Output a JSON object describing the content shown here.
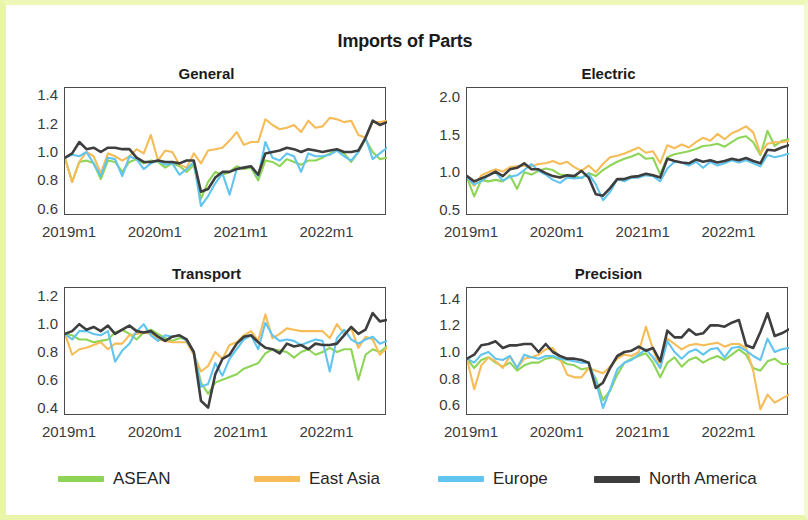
{
  "figure": {
    "title": "Imports of Parts",
    "background_color": "#ffffff",
    "frame_color": "#e9f5a8"
  },
  "legend": {
    "position": "bottom",
    "entries": [
      {
        "label": "ASEAN",
        "color": "#8ed557"
      },
      {
        "label": "East Asia",
        "color": "#f5bc57"
      },
      {
        "label": "Europe",
        "color": "#62c5ef"
      },
      {
        "label": "North America",
        "color": "#3e3e3e"
      }
    ]
  },
  "chart_data": [
    {
      "type": "line",
      "title": "General",
      "xlabel": "",
      "ylabel": "",
      "grid": false,
      "legend_position": "figure-bottom",
      "xticklabels": [
        "2019m1",
        "2020m1",
        "2021m1",
        "2022m1"
      ],
      "xtick_index": [
        0,
        12,
        24,
        36
      ],
      "yticks": [
        0.6,
        0.8,
        1.0,
        1.2,
        1.4
      ],
      "ylim": [
        0.55,
        1.45
      ],
      "xlim": [
        0,
        45
      ],
      "series": [
        {
          "name": "ASEAN",
          "color": "#8ed557",
          "values": [
            0.96,
            0.79,
            0.93,
            0.94,
            0.92,
            0.81,
            0.94,
            0.93,
            0.86,
            0.93,
            0.95,
            0.92,
            0.94,
            0.93,
            0.89,
            0.92,
            0.9,
            0.86,
            0.91,
            0.67,
            0.79,
            0.86,
            0.84,
            0.86,
            0.9,
            0.88,
            0.89,
            0.8,
            0.94,
            0.93,
            0.9,
            0.95,
            0.93,
            0.91,
            0.94,
            0.94,
            0.96,
            0.99,
            1.01,
            0.99,
            0.93,
            1.0,
            1.09,
            1.0,
            0.95,
            0.96
          ]
        },
        {
          "name": "East Asia",
          "color": "#f5bc57",
          "values": [
            0.95,
            0.79,
            0.93,
            1.0,
            0.97,
            0.85,
            0.99,
            0.97,
            0.94,
            0.97,
            1.02,
            0.99,
            1.12,
            0.94,
            1.01,
            1.0,
            0.91,
            0.89,
            0.99,
            0.92,
            1.01,
            1.02,
            1.03,
            1.08,
            1.14,
            1.05,
            1.07,
            1.07,
            1.23,
            1.19,
            1.16,
            1.17,
            1.19,
            1.14,
            1.22,
            1.17,
            1.18,
            1.24,
            1.23,
            1.21,
            1.22,
            1.12,
            1.1,
            1.21,
            1.21,
            1.22
          ]
        },
        {
          "name": "Europe",
          "color": "#62c5ef",
          "values": [
            0.96,
            0.98,
            0.97,
            1.0,
            0.92,
            0.83,
            0.96,
            0.95,
            0.83,
            0.97,
            0.95,
            0.88,
            0.92,
            0.94,
            0.91,
            0.92,
            0.84,
            0.88,
            0.93,
            0.62,
            0.69,
            0.78,
            0.85,
            0.7,
            0.88,
            0.89,
            0.9,
            0.83,
            1.07,
            0.96,
            0.94,
            0.99,
            0.97,
            0.86,
            0.99,
            0.97,
            0.97,
            0.98,
            1.01,
            0.97,
            0.94,
            1.0,
            1.1,
            0.95,
            0.99,
            1.03
          ]
        },
        {
          "name": "North America",
          "color": "#3e3e3e",
          "values": [
            0.96,
            0.99,
            1.07,
            1.02,
            1.03,
            1.0,
            1.03,
            1.03,
            1.02,
            1.02,
            0.96,
            0.93,
            0.93,
            0.94,
            0.93,
            0.93,
            0.92,
            0.94,
            0.94,
            0.72,
            0.74,
            0.82,
            0.86,
            0.86,
            0.88,
            0.89,
            0.9,
            0.84,
            0.99,
            1.0,
            1.01,
            1.03,
            1.02,
            1.0,
            1.02,
            1.01,
            1.0,
            1.01,
            1.02,
            1.0,
            1.0,
            1.01,
            1.1,
            1.22,
            1.19,
            1.21
          ]
        }
      ]
    },
    {
      "type": "line",
      "title": "Electric",
      "xlabel": "",
      "ylabel": "",
      "grid": false,
      "legend_position": "figure-bottom",
      "xticklabels": [
        "2019m1",
        "2020m1",
        "2021m1",
        "2022m1"
      ],
      "xtick_index": [
        0,
        12,
        24,
        36
      ],
      "yticks": [
        0.5,
        1.0,
        1.5,
        2.0
      ],
      "ylim": [
        0.42,
        2.12
      ],
      "xlim": [
        0,
        45
      ],
      "series": [
        {
          "name": "ASEAN",
          "color": "#8ed557",
          "values": [
            0.93,
            0.68,
            0.9,
            0.88,
            0.9,
            0.88,
            0.96,
            0.78,
            1.0,
            0.97,
            1.02,
            1.05,
            1.03,
            0.97,
            0.96,
            0.95,
            0.92,
            0.99,
            0.95,
            1.03,
            1.09,
            1.14,
            1.18,
            1.21,
            1.25,
            1.18,
            1.19,
            0.97,
            1.2,
            1.24,
            1.26,
            1.28,
            1.31,
            1.35,
            1.36,
            1.38,
            1.34,
            1.4,
            1.46,
            1.48,
            1.4,
            1.23,
            1.55,
            1.35,
            1.42,
            1.44
          ]
        },
        {
          "name": "East Asia",
          "color": "#f5bc57",
          "values": [
            0.93,
            0.82,
            0.96,
            1.0,
            1.04,
            1.01,
            1.07,
            1.08,
            1.09,
            1.08,
            1.11,
            1.12,
            1.15,
            1.11,
            1.14,
            1.07,
            1.02,
            1.09,
            1.0,
            1.11,
            1.2,
            1.22,
            1.25,
            1.29,
            1.33,
            1.26,
            1.28,
            1.12,
            1.36,
            1.32,
            1.37,
            1.33,
            1.4,
            1.46,
            1.42,
            1.51,
            1.44,
            1.52,
            1.56,
            1.61,
            1.53,
            1.25,
            1.38,
            1.4,
            1.4,
            1.42
          ]
        },
        {
          "name": "Europe",
          "color": "#62c5ef",
          "values": [
            0.93,
            0.84,
            0.88,
            0.96,
            1.0,
            0.89,
            0.94,
            0.96,
            1.03,
            1.11,
            1.02,
            0.97,
            0.9,
            0.86,
            0.93,
            0.92,
            0.93,
            0.98,
            0.84,
            0.63,
            0.74,
            0.91,
            0.88,
            0.93,
            0.93,
            0.96,
            0.95,
            0.88,
            1.05,
            1.14,
            1.13,
            1.09,
            1.14,
            1.06,
            1.14,
            1.09,
            1.12,
            1.16,
            1.13,
            1.16,
            1.12,
            1.08,
            1.23,
            1.2,
            1.22,
            1.25
          ]
        },
        {
          "name": "North America",
          "color": "#3e3e3e",
          "values": [
            0.95,
            0.88,
            0.92,
            0.96,
            1.01,
            0.95,
            1.04,
            1.06,
            1.12,
            1.04,
            1.04,
            0.99,
            0.95,
            0.93,
            0.96,
            0.95,
            1.02,
            0.93,
            0.71,
            0.69,
            0.79,
            0.91,
            0.91,
            0.94,
            0.95,
            0.98,
            0.96,
            0.93,
            1.18,
            1.15,
            1.13,
            1.12,
            1.17,
            1.14,
            1.16,
            1.13,
            1.15,
            1.18,
            1.16,
            1.19,
            1.15,
            1.12,
            1.3,
            1.29,
            1.33,
            1.36
          ]
        }
      ]
    },
    {
      "type": "line",
      "title": "Transport",
      "xlabel": "",
      "ylabel": "",
      "grid": false,
      "legend_position": "figure-bottom",
      "xticklabels": [
        "2019m1",
        "2020m1",
        "2021m1",
        "2022m1"
      ],
      "xtick_index": [
        0,
        12,
        24,
        36
      ],
      "yticks": [
        0.4,
        0.6,
        0.8,
        1.0,
        1.2
      ],
      "ylim": [
        0.34,
        1.26
      ],
      "xlim": [
        0,
        45
      ],
      "series": [
        {
          "name": "ASEAN",
          "color": "#8ed557",
          "values": [
            0.93,
            0.92,
            0.89,
            0.89,
            0.87,
            0.88,
            0.89,
            0.94,
            0.96,
            0.93,
            0.89,
            0.94,
            0.96,
            0.93,
            0.9,
            0.88,
            0.9,
            0.89,
            0.8,
            0.58,
            0.5,
            0.58,
            0.6,
            0.62,
            0.64,
            0.68,
            0.7,
            0.72,
            0.79,
            0.82,
            0.81,
            0.8,
            0.76,
            0.8,
            0.82,
            0.78,
            0.8,
            0.83,
            0.8,
            0.82,
            0.82,
            0.6,
            0.78,
            0.82,
            0.8,
            0.84
          ]
        },
        {
          "name": "East Asia",
          "color": "#f5bc57",
          "values": [
            0.93,
            0.78,
            0.82,
            0.83,
            0.85,
            0.87,
            0.82,
            0.86,
            0.86,
            0.92,
            0.93,
            0.94,
            0.93,
            0.89,
            0.88,
            0.87,
            0.87,
            0.87,
            0.78,
            0.66,
            0.7,
            0.8,
            0.75,
            0.85,
            0.87,
            0.92,
            0.95,
            0.88,
            1.07,
            0.9,
            0.93,
            0.97,
            0.96,
            0.95,
            0.95,
            0.95,
            0.95,
            0.9,
            1.0,
            0.93,
            0.97,
            0.83,
            0.91,
            0.89,
            0.78,
            0.83
          ]
        },
        {
          "name": "Europe",
          "color": "#62c5ef",
          "values": [
            0.93,
            0.89,
            0.95,
            0.95,
            0.93,
            0.92,
            0.95,
            0.73,
            0.81,
            0.86,
            0.95,
            1.0,
            0.92,
            0.88,
            0.92,
            0.91,
            0.92,
            0.88,
            0.8,
            0.55,
            0.57,
            0.72,
            0.63,
            0.75,
            0.82,
            0.89,
            0.92,
            0.82,
            1.01,
            0.92,
            0.88,
            0.89,
            0.88,
            0.85,
            0.87,
            0.89,
            0.88,
            0.66,
            0.9,
            0.96,
            0.89,
            0.86,
            0.89,
            0.91,
            0.86,
            0.88
          ]
        },
        {
          "name": "North America",
          "color": "#3e3e3e",
          "values": [
            0.93,
            0.95,
            1.0,
            0.96,
            0.98,
            0.95,
            0.99,
            0.93,
            0.96,
            0.99,
            0.95,
            0.94,
            0.95,
            0.91,
            0.88,
            0.91,
            0.92,
            0.89,
            0.8,
            0.45,
            0.4,
            0.64,
            0.75,
            0.78,
            0.86,
            0.91,
            0.92,
            0.87,
            0.83,
            0.82,
            0.79,
            0.86,
            0.84,
            0.85,
            0.82,
            0.86,
            0.85,
            0.85,
            0.86,
            0.92,
            0.98,
            0.93,
            0.96,
            1.08,
            1.02,
            1.03
          ]
        }
      ]
    },
    {
      "type": "line",
      "title": "Precision",
      "xlabel": "",
      "ylabel": "",
      "grid": false,
      "legend_position": "figure-bottom",
      "xticklabels": [
        "2019m1",
        "2020m1",
        "2021m1",
        "2022m1"
      ],
      "xtick_index": [
        0,
        12,
        24,
        36
      ],
      "yticks": [
        0.6,
        0.8,
        1.0,
        1.2,
        1.4
      ],
      "ylim": [
        0.52,
        1.48
      ],
      "xlim": [
        0,
        45
      ],
      "series": [
        {
          "name": "ASEAN",
          "color": "#8ed557",
          "values": [
            0.95,
            0.88,
            0.94,
            0.96,
            0.92,
            0.89,
            0.92,
            0.86,
            0.9,
            0.92,
            0.92,
            0.95,
            0.96,
            0.94,
            0.91,
            0.9,
            0.87,
            0.88,
            0.8,
            0.64,
            0.71,
            0.83,
            0.92,
            0.95,
            0.97,
            0.99,
            0.92,
            0.81,
            0.92,
            0.96,
            0.89,
            0.94,
            0.96,
            0.92,
            0.95,
            0.97,
            0.94,
            0.98,
            1.02,
            0.98,
            0.88,
            0.86,
            0.93,
            0.95,
            0.91,
            0.91
          ]
        },
        {
          "name": "East Asia",
          "color": "#f5bc57",
          "values": [
            0.95,
            0.72,
            0.9,
            0.96,
            0.93,
            0.88,
            0.97,
            0.88,
            0.95,
            0.96,
            0.98,
            1.02,
            1.03,
            0.95,
            0.83,
            0.81,
            0.81,
            0.88,
            0.86,
            0.84,
            0.89,
            0.95,
            0.98,
            0.97,
            1.0,
            1.19,
            1.02,
            0.88,
            1.1,
            1.06,
            1.02,
            1.05,
            1.06,
            1.05,
            1.06,
            1.07,
            1.04,
            1.06,
            1.06,
            1.03,
            0.86,
            0.57,
            0.68,
            0.62,
            0.65,
            0.68
          ]
        },
        {
          "name": "Europe",
          "color": "#62c5ef",
          "values": [
            0.95,
            0.92,
            0.98,
            1.0,
            0.95,
            0.94,
            0.97,
            0.88,
            0.98,
            0.96,
            0.95,
            0.97,
            0.97,
            0.95,
            0.94,
            0.93,
            0.92,
            0.92,
            0.78,
            0.58,
            0.72,
            0.87,
            0.92,
            0.94,
            0.98,
            1.02,
            0.96,
            0.88,
            1.08,
            1.0,
            0.95,
            1.0,
            1.02,
            0.98,
            1.02,
            1.03,
            0.96,
            1.03,
            1.04,
            1.01,
            0.97,
            0.94,
            1.1,
            1.0,
            1.02,
            1.03
          ]
        },
        {
          "name": "North America",
          "color": "#3e3e3e",
          "values": [
            0.95,
            0.98,
            1.05,
            1.06,
            1.08,
            1.03,
            1.05,
            1.05,
            1.06,
            1.06,
            1.0,
            1.06,
            1.0,
            0.97,
            0.95,
            0.95,
            0.94,
            0.92,
            0.73,
            0.77,
            0.88,
            0.97,
            1.0,
            1.01,
            1.04,
            1.01,
            1.03,
            0.93,
            1.16,
            1.11,
            1.11,
            1.17,
            1.13,
            1.14,
            1.2,
            1.2,
            1.19,
            1.22,
            1.24,
            1.05,
            1.03,
            1.15,
            1.29,
            1.12,
            1.14,
            1.17
          ]
        }
      ]
    }
  ]
}
